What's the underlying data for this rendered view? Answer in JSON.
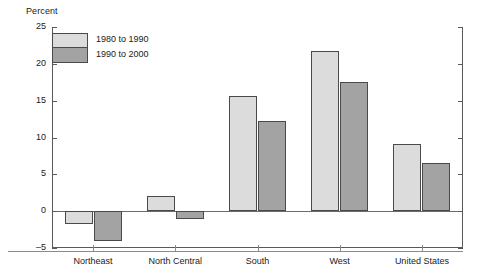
{
  "chart_data": {
    "type": "bar",
    "title": "",
    "xlabel": "",
    "ylabel": "Percent",
    "ylim": [
      -5,
      25
    ],
    "yticks": [
      25,
      20,
      15,
      10,
      5,
      0,
      -5
    ],
    "ytick_labels": [
      "25",
      "20",
      "15",
      "10",
      "5",
      "0",
      "–5"
    ],
    "grid": false,
    "legend_position": "top-left",
    "categories": [
      "Northeast",
      "North Central",
      "South",
      "West",
      "United States"
    ],
    "series": [
      {
        "name": "1980 to 1990",
        "color": "#dcdcdc",
        "values": [
          -1.8,
          2.0,
          15.6,
          21.7,
          9.1
        ]
      },
      {
        "name": "1990 to 2000",
        "color": "#a3a3a3",
        "values": [
          -4.1,
          -1.1,
          12.3,
          17.5,
          6.6
        ]
      }
    ]
  }
}
